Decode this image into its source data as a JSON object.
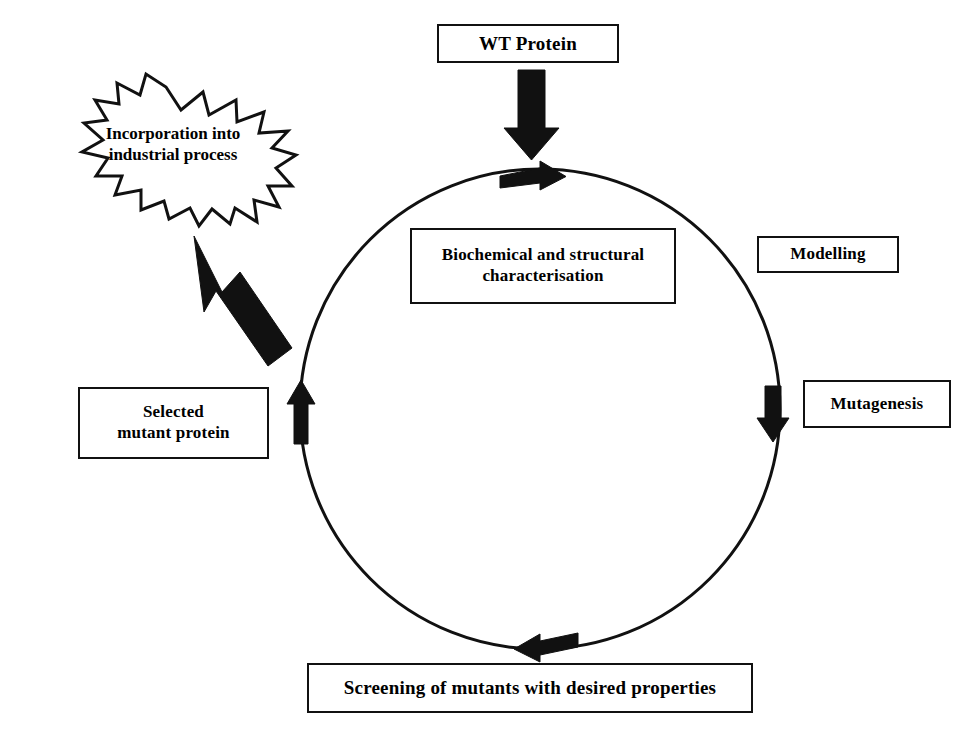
{
  "diagram": {
    "background_color": "#ffffff",
    "stroke_color": "#111111",
    "fill_color": "#ffffff",
    "nodes": {
      "wt_protein": {
        "label": "WT Protein",
        "shape": "rectangle"
      },
      "biochemical": {
        "label": "Biochemical and structural\ncharacterisation",
        "shape": "rectangle"
      },
      "modelling": {
        "label": "Modelling",
        "shape": "rectangle"
      },
      "mutagenesis": {
        "label": "Mutagenesis",
        "shape": "rectangle"
      },
      "screening": {
        "label": "Screening of mutants with desired properties",
        "shape": "rectangle"
      },
      "selected_mutant": {
        "label": "Selected\nmutant protein",
        "shape": "rectangle"
      },
      "incorporation": {
        "label": "Incorporation into\nindustrial process",
        "shape": "starburst"
      }
    },
    "connectors": {
      "wt_to_cycle": {
        "name": "entry-arrow",
        "direction": "down"
      },
      "cycle_top": {
        "name": "cycle-arrow-top",
        "direction": "right"
      },
      "cycle_right": {
        "name": "cycle-arrow-right",
        "direction": "down"
      },
      "cycle_bottom": {
        "name": "cycle-arrow-bottom",
        "direction": "left"
      },
      "cycle_left": {
        "name": "cycle-arrow-left",
        "direction": "up"
      },
      "exit_to_burst": {
        "name": "exit-arrow",
        "direction": "up-left"
      }
    },
    "cycle_ring": {
      "center_x": 540,
      "center_y": 409,
      "radius": 240,
      "clockwise": true
    }
  }
}
